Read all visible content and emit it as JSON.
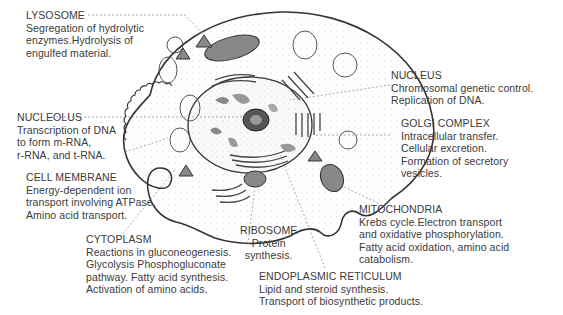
{
  "diagram": {
    "labels": [
      {
        "id": "lysosome",
        "title": "LYSOSOME",
        "lines": [
          "Segregation of hydrolytic",
          "enzymes.Hydrolysis of",
          "engulfed material."
        ]
      },
      {
        "id": "nucleolus",
        "title": "NUCLEOLUS",
        "lines": [
          "Transcription of DNA",
          "to form m-RNA,",
          "r-RNA, and t-RNA."
        ]
      },
      {
        "id": "cell-membrane",
        "title": "CELL MEMBRANE",
        "lines": [
          "Energy-dependent ion",
          "transport involving ATPase.",
          "Amino acid transport."
        ]
      },
      {
        "id": "cytoplasm",
        "title": "CYTOPLASM",
        "lines": [
          "Reactions in gluconeogenesis.",
          "Glycolysis Phosphogluconate",
          "pathway. Fatty acid synthesis.",
          "Activation of amino acids."
        ]
      },
      {
        "id": "ribosome",
        "title": "RIBOSOME",
        "lines": [
          "Protein",
          "synthesis."
        ]
      },
      {
        "id": "endoplasmic-reticulum",
        "title": "ENDOPLASMIC RETICULUM",
        "lines": [
          "Lipid and steroid synthesis.",
          "Transport of biosynthetic products."
        ]
      },
      {
        "id": "mitochondria",
        "title": "MITOCHONDRIA",
        "lines": [
          "Krebs cycle.Electron transport",
          "and oxidative phosphorylation.",
          "Fatty acid oxidation, amino acid",
          "catabolism."
        ]
      },
      {
        "id": "golgi-complex",
        "title": "GOLGI COMPLEX",
        "lines": [
          "Intracellular transfer.",
          "Cellular excretion.",
          "Formation of secretory",
          "vesicles."
        ]
      },
      {
        "id": "nucleus",
        "title": "NUCLEUS",
        "lines": [
          "Chromosomal genetic control.",
          "Replication of DNA."
        ]
      }
    ]
  }
}
